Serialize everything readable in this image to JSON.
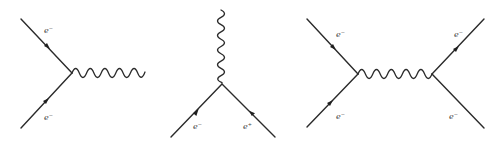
{
  "diagrams": [
    {
      "name": "electron-electron-photon-vertex",
      "labels": {
        "top": "e⁻",
        "bottom": "e⁻"
      }
    },
    {
      "name": "electron-positron-annihilation",
      "labels": {
        "left": "e⁻",
        "right": "e⁺"
      }
    },
    {
      "name": "electron-electron-scattering",
      "labels": {
        "top_left": "e⁻",
        "bottom_left": "e⁻",
        "top_right": "e⁻",
        "bottom_right": "e⁻"
      }
    }
  ],
  "colors": {
    "line": "#2b2b2b",
    "background": "#ffffff"
  }
}
